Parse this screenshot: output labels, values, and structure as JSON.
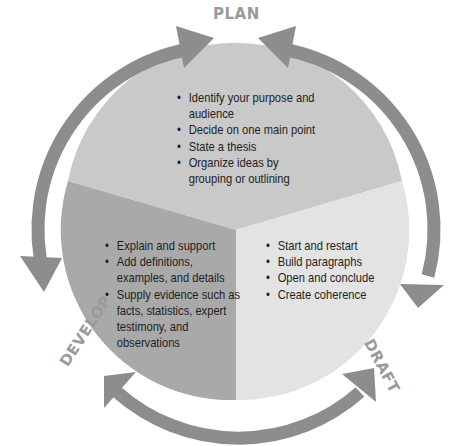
{
  "diagram": {
    "type": "cycle",
    "colors": {
      "plan_sector": "#c9c9c9",
      "develop_sector": "#a9a9a9",
      "draft_sector": "#e3e3e3",
      "arrows": "#8d8d8d",
      "stage_label": "#9a9a9a",
      "text": "#1e1e1e"
    },
    "stages": [
      {
        "name": "PLAN",
        "bullets": [
          "Identify your purpose and audience",
          "Decide on one main point",
          "State a thesis",
          "Organize ideas by grouping or outlining"
        ]
      },
      {
        "name": "DRAFT",
        "bullets": [
          "Start and restart",
          "Build paragraphs",
          "Open and conclude",
          "Create coherence"
        ]
      },
      {
        "name": "DEVELOP",
        "bullets": [
          "Explain and support",
          "Add definitions, examples, and details",
          "Supply evidence such as facts, statistics, expert testimony, and observations"
        ]
      }
    ],
    "arrows": [
      {
        "between": [
          "PLAN",
          "DEVELOP"
        ],
        "double_headed": true
      },
      {
        "between": [
          "PLAN",
          "DRAFT"
        ],
        "double_headed": true
      },
      {
        "between": [
          "DEVELOP",
          "DRAFT"
        ],
        "double_headed": true
      }
    ]
  }
}
